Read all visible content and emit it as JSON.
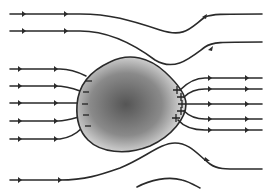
{
  "diagram": {
    "colors": {
      "line": "#2a2a2a",
      "conductor_light": "#f2f2f2",
      "conductor_dark": "#5a5a5a",
      "background": "#ffffff"
    },
    "negative_charge_symbol": "−",
    "positive_charge_symbol": "+",
    "negative_charge_count": 5,
    "positive_charge_count": 5,
    "field_direction": "left-to-right"
  }
}
